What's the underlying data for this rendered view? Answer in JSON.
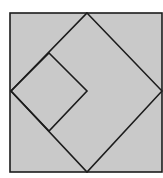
{
  "diagram": {
    "colors": {
      "background": "#ffffff",
      "fill": "#c9c9c9",
      "stroke": "#1c1c1c"
    },
    "outer_square": {
      "x": 10,
      "y": 13,
      "width": 152,
      "height": 159
    },
    "diamond": {
      "points": [
        [
          87,
          13
        ],
        [
          162,
          91
        ],
        [
          87,
          172
        ],
        [
          11,
          91
        ]
      ]
    },
    "inner_square": {
      "points": [
        [
          49,
          53
        ],
        [
          87,
          91
        ],
        [
          49,
          131
        ],
        [
          11,
          91
        ]
      ]
    },
    "labels": []
  }
}
